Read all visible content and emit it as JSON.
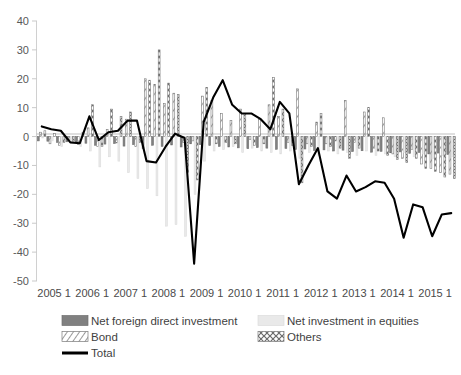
{
  "chart_data": {
    "type": "bar",
    "title": "",
    "xlabel": "",
    "ylabel": "",
    "ylim": [
      -50,
      40
    ],
    "ytick_step": 10,
    "yticks": [
      40,
      30,
      20,
      10,
      0,
      -10,
      -20,
      -30,
      -40,
      -50
    ],
    "grid": false,
    "legend_position": "bottom",
    "categories": [
      "2005 1",
      "2005 2",
      "2005 3",
      "2005 4",
      "2006 1",
      "2006 2",
      "2006 3",
      "2006 4",
      "2007 1",
      "2007 2",
      "2007 3",
      "2007 4",
      "2008 1",
      "2008 2",
      "2008 3",
      "2008 4",
      "2009 1",
      "2009 2",
      "2009 3",
      "2009 4",
      "2010 1",
      "2010 2",
      "2010 3",
      "2010 4",
      "2011 1",
      "2011 2",
      "2011 3",
      "2011 4",
      "2012 1",
      "2012 2",
      "2012 3",
      "2012 4",
      "2013 1",
      "2013 2",
      "2013 3",
      "2013 4",
      "2014 1",
      "2014 2",
      "2014 3",
      "2014 4",
      "2015 1",
      "2015 2",
      "2015 3",
      "2015 4"
    ],
    "xtick_labels": [
      "2005 1",
      "2006 1",
      "2007 1",
      "2008 1",
      "2009 1",
      "2010 1",
      "2011 1",
      "2012 1",
      "2013 1",
      "2014 1",
      "2015 1"
    ],
    "series": [
      {
        "name": "Net foreign direct investment",
        "pattern": "solid-gray",
        "color": "#808080",
        "values": [
          -1.5,
          -1.6,
          -2.0,
          -1.8,
          -1.9,
          -2.3,
          -3.0,
          -2.6,
          -2.4,
          -3.3,
          -2.8,
          -4.2,
          -3.0,
          -3.4,
          -2.9,
          -3.6,
          -2.5,
          -2.8,
          -3.1,
          -3.4,
          -3.6,
          -3.9,
          -4.2,
          -3.8,
          -4.0,
          -4.4,
          -4.1,
          -4.5,
          -4.3,
          -4.8,
          -4.6,
          -5.0,
          -4.7,
          -5.2,
          -4.9,
          -5.4,
          -5.1,
          -5.6,
          -5.3,
          -5.8,
          -5.5,
          -6.0,
          -5.7,
          -6.2
        ]
      },
      {
        "name": "Bond",
        "pattern": "hatched-white",
        "color": "#ffffff",
        "values": [
          1.5,
          -2.5,
          -3.0,
          -1.0,
          -2.8,
          3.0,
          -3.5,
          2.5,
          -2.2,
          6.0,
          -3.5,
          20.0,
          18.0,
          11.5,
          15.0,
          -2.0,
          -1.5,
          14.0,
          12.5,
          8.0,
          5.5,
          9.5,
          -1.0,
          6.0,
          11.0,
          7.0,
          -2.0,
          16.5,
          -2.5,
          5.0,
          -2.5,
          -1.5,
          12.5,
          -2.0,
          8.5,
          -4.0,
          6.5,
          -6.0,
          -7.5,
          -4.5,
          -9.5,
          -11.0,
          -12.5,
          -13.0
        ]
      },
      {
        "name": "Net investment in equities",
        "pattern": "light-gray",
        "color": "#e8e8e8",
        "values": [
          -0.5,
          -1.5,
          -3.5,
          -2.0,
          -3.5,
          -5.0,
          -10.5,
          -7.0,
          -8.5,
          -12.5,
          -14.5,
          -18.0,
          -20.5,
          -31.0,
          -30.5,
          -34.5,
          -20.0,
          -8.5,
          -5.0,
          -4.5,
          -3.5,
          -5.5,
          -4.0,
          -5.0,
          -5.5,
          -6.0,
          -5.0,
          -7.5,
          -5.5,
          -6.5,
          -5.0,
          -6.0,
          -5.5,
          -6.5,
          -5.0,
          -6.5,
          -6.0,
          -7.0,
          -5.5,
          -7.0,
          -6.0,
          -7.5,
          -6.5,
          -7.0
        ]
      },
      {
        "name": "Others",
        "pattern": "xxx-white",
        "color": "#ffffff",
        "values": [
          2.0,
          1.0,
          -2.0,
          -1.5,
          1.5,
          11.0,
          -3.5,
          9.5,
          7.0,
          8.5,
          -2.0,
          19.5,
          30.0,
          18.5,
          14.5,
          -12.5,
          -15.0,
          17.0,
          -2.5,
          -2.0,
          -2.5,
          8.0,
          -3.0,
          -2.5,
          20.5,
          9.5,
          -3.0,
          -16.0,
          -3.5,
          8.0,
          -3.5,
          -4.0,
          -7.5,
          -4.0,
          10.0,
          -5.0,
          -6.5,
          -8.0,
          -9.0,
          -7.5,
          -11.0,
          -12.0,
          -14.0,
          -14.5
        ]
      }
    ],
    "line_series": {
      "name": "Total",
      "color": "#000000",
      "values": [
        3.5,
        2.5,
        2.0,
        -2.0,
        -2.3,
        7.0,
        -1.2,
        1.5,
        2.0,
        5.5,
        5.5,
        -8.5,
        -9.0,
        -3.5,
        1.0,
        -0.5,
        -44.0,
        5.0,
        13.5,
        19.5,
        11.0,
        8.0,
        8.0,
        6.0,
        2.5,
        12.0,
        8.0,
        -16.5,
        -10.0,
        -4.0,
        -19.0,
        -21.5,
        -13.5,
        -19.0,
        -17.5,
        -15.5,
        -16.0,
        -21.5,
        -35.0,
        -23.5,
        -24.5,
        -34.5,
        -27.0,
        -26.5
      ]
    },
    "legend": [
      {
        "label": "Net foreign direct investment",
        "swatch": "solid-gray"
      },
      {
        "label": "Net investment in equities",
        "swatch": "light-gray"
      },
      {
        "label": "Bond",
        "swatch": "hatched-white"
      },
      {
        "label": "Others",
        "swatch": "xxx-white"
      },
      {
        "label": "Total",
        "swatch": "line-black"
      }
    ]
  }
}
